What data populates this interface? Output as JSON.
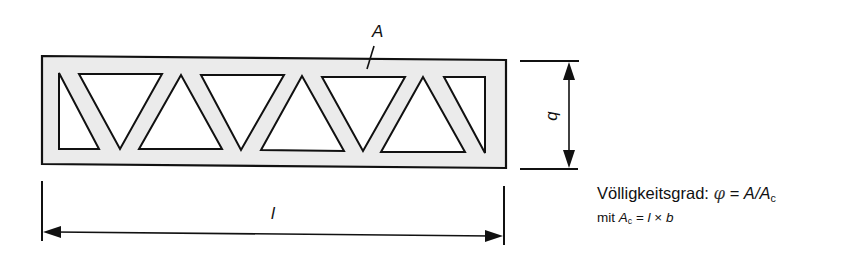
{
  "diagram": {
    "colors": {
      "fill": "#ebebeb",
      "stroke": "#111111",
      "background": "#ffffff"
    },
    "labels": {
      "area": "A",
      "length": "l",
      "width": "b"
    },
    "formula": {
      "line1_prefix": "Völligkeitsgrad: ",
      "phi": "φ",
      "equals": " = ",
      "A": "A",
      "slash": "/",
      "Ac_base": "A",
      "Ac_sub": "c",
      "line2_prefix": "mit ",
      "line2_Ac_base": "A",
      "line2_Ac_sub": "c",
      "line2_equals": " = ",
      "line2_l": "l",
      "line2_times": " × ",
      "line2_b": "b"
    }
  }
}
